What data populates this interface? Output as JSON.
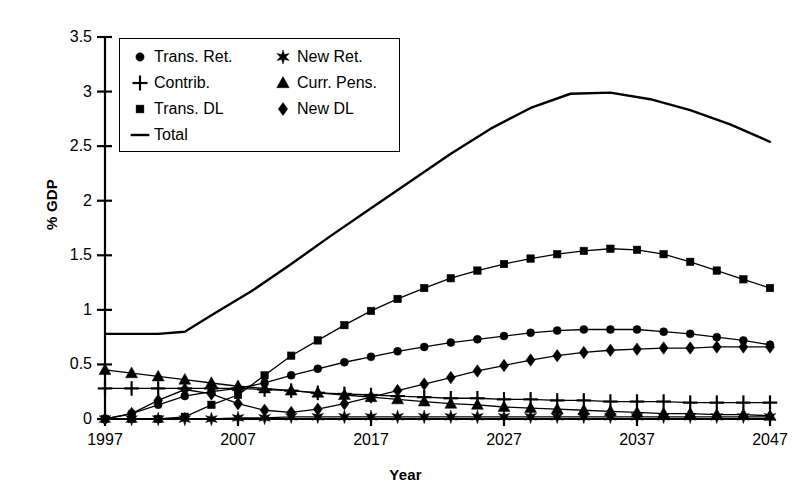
{
  "chart_data": {
    "type": "line",
    "title": "",
    "xlabel": "Year",
    "ylabel": "% GDP",
    "xlim": [
      1997,
      2047
    ],
    "ylim": [
      0,
      3.5
    ],
    "grid": false,
    "legend_position": "top-left",
    "x_ticks": [
      "1997",
      "2007",
      "2017",
      "2027",
      "2037",
      "2047"
    ],
    "x_tick_values": [
      1997,
      2007,
      2017,
      2027,
      2037,
      2047
    ],
    "y_ticks": [
      "0",
      "0.5",
      "1",
      "1.5",
      "2",
      "2.5",
      "3",
      "3.5"
    ],
    "y_tick_values": [
      0,
      0.5,
      1,
      1.5,
      2,
      2.5,
      3,
      3.5
    ],
    "x": [
      1997,
      1999,
      2001,
      2003,
      2005,
      2007,
      2009,
      2011,
      2013,
      2015,
      2017,
      2019,
      2021,
      2023,
      2025,
      2027,
      2029,
      2031,
      2033,
      2035,
      2037,
      2039,
      2041,
      2043,
      2045,
      2047
    ],
    "series": [
      {
        "name": "Trans. Ret.",
        "marker": "circle",
        "values": [
          0.0,
          0.05,
          0.13,
          0.21,
          0.25,
          0.28,
          0.33,
          0.4,
          0.46,
          0.52,
          0.57,
          0.62,
          0.66,
          0.7,
          0.73,
          0.76,
          0.79,
          0.81,
          0.82,
          0.82,
          0.82,
          0.8,
          0.78,
          0.75,
          0.72,
          0.68
        ]
      },
      {
        "name": "New Ret.",
        "marker": "star",
        "values": [
          0.0,
          0.0,
          0.0,
          0.0,
          0.0,
          0.01,
          0.01,
          0.02,
          0.02,
          0.02,
          0.02,
          0.02,
          0.02,
          0.02,
          0.02,
          0.02,
          0.02,
          0.02,
          0.02,
          0.02,
          0.02,
          0.02,
          0.02,
          0.02,
          0.02,
          0.02
        ]
      },
      {
        "name": "Contrib.",
        "marker": "plus",
        "values": [
          0.28,
          0.28,
          0.28,
          0.28,
          0.28,
          0.28,
          0.27,
          0.26,
          0.24,
          0.23,
          0.22,
          0.21,
          0.2,
          0.19,
          0.19,
          0.18,
          0.18,
          0.17,
          0.17,
          0.16,
          0.16,
          0.16,
          0.15,
          0.15,
          0.15,
          0.15
        ]
      },
      {
        "name": "Curr. Pens.",
        "marker": "triangle",
        "values": [
          0.45,
          0.42,
          0.39,
          0.36,
          0.33,
          0.3,
          0.28,
          0.26,
          0.24,
          0.22,
          0.2,
          0.18,
          0.16,
          0.14,
          0.13,
          0.11,
          0.1,
          0.09,
          0.08,
          0.07,
          0.06,
          0.05,
          0.05,
          0.04,
          0.04,
          0.03
        ]
      },
      {
        "name": "Trans. DL",
        "marker": "square",
        "values": [
          0.0,
          0.0,
          0.0,
          0.02,
          0.13,
          0.22,
          0.4,
          0.58,
          0.72,
          0.86,
          0.99,
          1.1,
          1.2,
          1.29,
          1.36,
          1.42,
          1.47,
          1.51,
          1.54,
          1.56,
          1.55,
          1.51,
          1.44,
          1.36,
          1.28,
          1.2
        ]
      },
      {
        "name": "New  DL",
        "marker": "diamond",
        "values": [
          0.0,
          0.05,
          0.17,
          0.27,
          0.23,
          0.14,
          0.08,
          0.06,
          0.09,
          0.14,
          0.2,
          0.26,
          0.32,
          0.38,
          0.44,
          0.49,
          0.54,
          0.58,
          0.61,
          0.63,
          0.64,
          0.65,
          0.65,
          0.66,
          0.66,
          0.66
        ]
      }
    ],
    "total_series": {
      "name": "Total",
      "marker": "line",
      "x": [
        1997,
        2001,
        2003,
        2005,
        2008,
        2011,
        2014,
        2017,
        2020,
        2023,
        2026,
        2029,
        2032,
        2035,
        2038,
        2041,
        2044,
        2047
      ],
      "values": [
        0.78,
        0.78,
        0.8,
        0.95,
        1.17,
        1.42,
        1.68,
        1.93,
        2.18,
        2.43,
        2.66,
        2.85,
        2.98,
        2.99,
        2.93,
        2.83,
        2.7,
        2.54
      ]
    }
  },
  "legend": {
    "entries": [
      {
        "label": "Trans. Ret.",
        "marker": "circle",
        "column": 0,
        "row": 0
      },
      {
        "label": "New Ret.",
        "marker": "star",
        "column": 1,
        "row": 0
      },
      {
        "label": "Contrib.",
        "marker": "plus",
        "column": 0,
        "row": 1
      },
      {
        "label": "Curr. Pens.",
        "marker": "triangle",
        "column": 1,
        "row": 1
      },
      {
        "label": "Trans. DL",
        "marker": "square",
        "column": 0,
        "row": 2
      },
      {
        "label": "New  DL",
        "marker": "diamond",
        "column": 1,
        "row": 2
      },
      {
        "label": "Total",
        "marker": "line",
        "column": 0,
        "row": 3
      }
    ]
  },
  "axes": {
    "y_title": "% GDP",
    "x_title": "Year"
  },
  "style": {
    "ink": "#000000",
    "background": "#ffffff"
  }
}
